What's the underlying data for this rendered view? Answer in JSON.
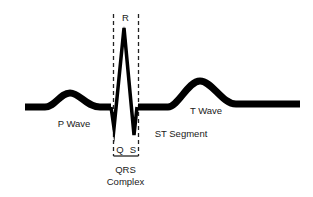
{
  "diagram": {
    "type": "ecg-waveform",
    "labels": {
      "r": "R",
      "q": "Q",
      "s": "S",
      "p_wave": "P Wave",
      "t_wave": "T Wave",
      "st_segment": "ST Segment",
      "qrs_line1": "QRS",
      "qrs_line2": "Complex"
    },
    "colors": {
      "waveform": "#000000",
      "dashed_box": "#222222",
      "text": "#1a1a1a",
      "background": "#ffffff"
    }
  }
}
